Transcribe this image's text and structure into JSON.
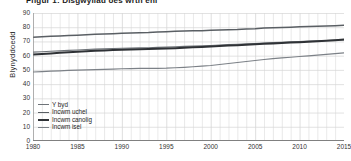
{
  "title": "Ffigur 1: Disgwyliad oes wrth eni",
  "axis": {
    "ylabel": "Blynyddoedd",
    "yticks": [
      0,
      10,
      20,
      30,
      40,
      50,
      60,
      70,
      80,
      90
    ],
    "xticks": [
      1980,
      1985,
      1990,
      1995,
      2000,
      2005,
      2010,
      2015
    ]
  },
  "colors": {
    "world": "#6e7378",
    "high_income": "#5a5f64",
    "middle_income": "#2f3236",
    "low_income": "#7c8187",
    "grid": "#d6d6d6",
    "axis": "#808080"
  },
  "legend": [
    {
      "label": "Y byd",
      "color": "#6e7378",
      "width": 1.1
    },
    {
      "label": "Incwm uchel",
      "color": "#5a5f64",
      "width": 1.5
    },
    {
      "label": "Incwm canolig",
      "color": "#2f3236",
      "width": 2.0
    },
    {
      "label": "Incwm isel",
      "color": "#7c8187",
      "width": 1.2
    }
  ],
  "chart_data": {
    "type": "line",
    "title": "Ffigur 1: Disgwyliad oes wrth eni",
    "xlabel": "",
    "ylabel": "Blynyddoedd",
    "xlim": [
      1980,
      2015
    ],
    "ylim": [
      0,
      90
    ],
    "grid": true,
    "legend_position": "lower-left",
    "x": [
      1980,
      1981,
      1982,
      1983,
      1984,
      1985,
      1986,
      1987,
      1988,
      1989,
      1990,
      1991,
      1992,
      1993,
      1994,
      1995,
      1996,
      1997,
      1998,
      1999,
      2000,
      2001,
      2002,
      2003,
      2004,
      2005,
      2006,
      2007,
      2008,
      2009,
      2010,
      2011,
      2012,
      2013,
      2014,
      2015
    ],
    "series": [
      {
        "name": "Incwm uchel",
        "color": "#5a5f64",
        "values": [
          73.0,
          73.3,
          73.6,
          73.8,
          74.1,
          74.4,
          74.7,
          75.0,
          75.2,
          75.4,
          75.7,
          75.9,
          76.2,
          76.3,
          76.6,
          76.8,
          77.1,
          77.3,
          77.5,
          77.6,
          77.9,
          78.1,
          78.3,
          78.4,
          78.8,
          78.9,
          79.4,
          79.6,
          79.8,
          80.0,
          80.3,
          80.5,
          80.7,
          80.9,
          81.1,
          81.4
        ]
      },
      {
        "name": "Y byd",
        "color": "#6e7378",
        "values": [
          62.5,
          62.8,
          63.1,
          63.4,
          63.7,
          64.0,
          64.3,
          64.6,
          64.8,
          65.0,
          65.2,
          65.3,
          65.5,
          65.6,
          65.8,
          66.0,
          66.3,
          66.5,
          66.7,
          66.9,
          67.2,
          67.5,
          67.8,
          68.0,
          68.3,
          68.6,
          68.9,
          69.2,
          69.4,
          69.7,
          70.0,
          70.2,
          70.5,
          70.7,
          70.9,
          71.1
        ]
      },
      {
        "name": "Incwm canolig",
        "color": "#2f3236",
        "values": [
          60.8,
          61.2,
          61.6,
          62.0,
          62.4,
          62.8,
          63.1,
          63.4,
          63.7,
          63.9,
          64.1,
          64.3,
          64.5,
          64.6,
          64.8,
          65.0,
          65.3,
          65.6,
          65.9,
          66.1,
          66.4,
          66.8,
          67.1,
          67.4,
          67.7,
          68.0,
          68.3,
          68.6,
          68.9,
          69.2,
          69.5,
          69.8,
          70.1,
          70.5,
          70.9,
          71.4
        ]
      },
      {
        "name": "Incwm isel",
        "color": "#7c8187",
        "values": [
          48.5,
          48.8,
          49.1,
          49.3,
          49.6,
          49.8,
          50.0,
          50.2,
          50.4,
          50.6,
          50.8,
          50.9,
          51.0,
          51.0,
          51.1,
          51.2,
          51.5,
          51.8,
          52.2,
          52.6,
          53.1,
          53.8,
          54.5,
          55.2,
          55.9,
          56.6,
          57.3,
          57.9,
          58.4,
          58.9,
          59.4,
          59.9,
          60.4,
          60.9,
          61.4,
          61.9
        ]
      }
    ]
  }
}
